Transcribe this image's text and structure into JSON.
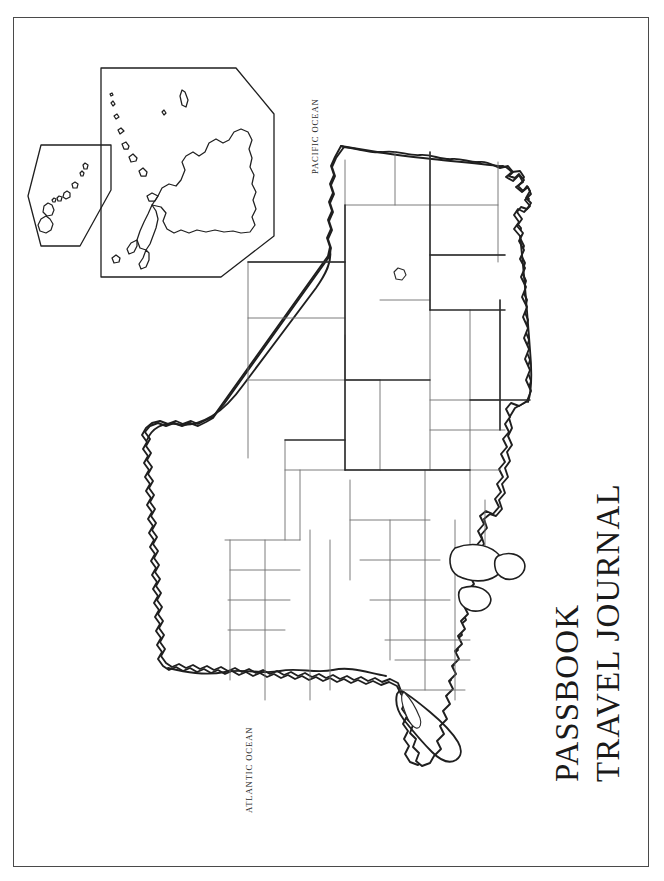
{
  "page": {
    "background_color": "#ffffff",
    "border_color": "#4a4a4a",
    "ink_color": "#2b2b2b"
  },
  "cover": {
    "title_line_1": "Travel Journal",
    "title_line_2": "Passbook",
    "title_orientation": "rotated-90-ccw"
  },
  "map": {
    "projection_note": "United States outline map rotated 90 degrees clockwise",
    "outline_color": "#1f1f1f",
    "state_border_color": "#6e6e6e",
    "labels": {
      "pacific_ocean": "Pacific Ocean",
      "atlantic_ocean": "Atlantic Ocean"
    },
    "insets": [
      {
        "name": "alaska-inset",
        "frame": "hexagon"
      },
      {
        "name": "hawaii-inset",
        "frame": "hexagon"
      }
    ]
  }
}
